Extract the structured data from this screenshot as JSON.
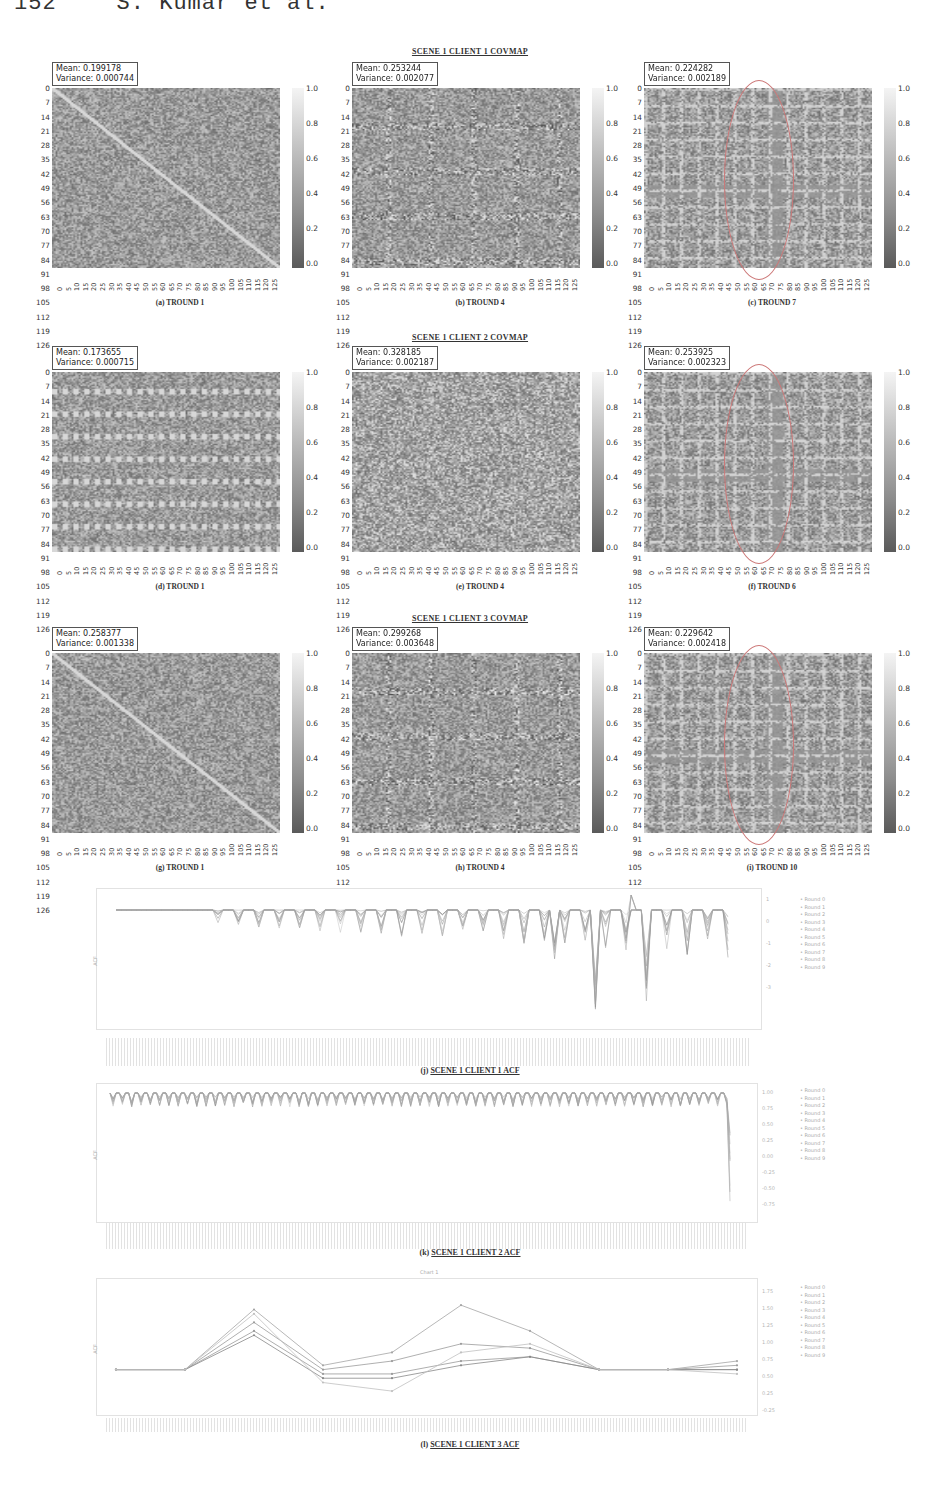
{
  "page": {
    "running_head": {
      "page_number": "152",
      "authors": "S. Kumar et al."
    }
  },
  "sections": [
    {
      "title": "SCENE 1 CLIENT 1 COVMAP"
    },
    {
      "title": "SCENE 1 CLIENT 2 COVMAP"
    },
    {
      "title": "SCENE 1 CLIENT 3 COVMAP"
    }
  ],
  "heatmap_axis": {
    "y_ticks": [
      "0",
      "7",
      "14",
      "21",
      "28",
      "35",
      "42",
      "49",
      "56",
      "63",
      "70",
      "77",
      "84",
      "91",
      "98",
      "105",
      "112",
      "119",
      "126"
    ],
    "x_ticks": [
      "0",
      "5",
      "10",
      "15",
      "20",
      "25",
      "30",
      "35",
      "40",
      "45",
      "50",
      "55",
      "60",
      "65",
      "70",
      "75",
      "80",
      "85",
      "90",
      "95",
      "100",
      "105",
      "110",
      "115",
      "120",
      "125"
    ],
    "colorbar_ticks": [
      "1.0",
      "0.8",
      "0.6",
      "0.4",
      "0.2",
      "0.0"
    ]
  },
  "panels": [
    {
      "id": "a",
      "caption": "(a) TROUND 1",
      "mean": "Mean: 0.199178",
      "variance": "Variance: 0.000744",
      "seed": 11,
      "pattern": "diagonal",
      "circled": false
    },
    {
      "id": "b",
      "caption": "(b) TROUND 4",
      "mean": "Mean: 0.253244",
      "variance": "Variance: 0.002077",
      "seed": 22,
      "pattern": "grid",
      "circled": false
    },
    {
      "id": "c",
      "caption": "(c) TROUND 7",
      "mean": "Mean: 0.224282",
      "variance": "Variance: 0.002189",
      "seed": 33,
      "pattern": "band",
      "circled": true
    },
    {
      "id": "d",
      "caption": "(d) TROUND 1",
      "mean": "Mean: 0.173655",
      "variance": "Variance: 0.000715",
      "seed": 44,
      "pattern": "stripes",
      "circled": false
    },
    {
      "id": "e",
      "caption": "(e) TROUND 4",
      "mean": "Mean: 0.328185",
      "variance": "Variance: 0.002187",
      "seed": 55,
      "pattern": "noise",
      "circled": false
    },
    {
      "id": "f",
      "caption": "(f) TROUND 6",
      "mean": "Mean: 0.253925",
      "variance": "Variance: 0.002323",
      "seed": 66,
      "pattern": "band",
      "circled": true
    },
    {
      "id": "g",
      "caption": "(g) TROUND 1",
      "mean": "Mean: 0.258377",
      "variance": "Variance: 0.001338",
      "seed": 77,
      "pattern": "diagonal",
      "circled": false
    },
    {
      "id": "h",
      "caption": "(h) TROUND 4",
      "mean": "Mean: 0.299268",
      "variance": "Variance: 0.003648",
      "seed": 88,
      "pattern": "grid",
      "circled": false
    },
    {
      "id": "i",
      "caption": "(i) TROUND 10",
      "mean": "Mean: 0.229642",
      "variance": "Variance: 0.002418",
      "seed": 99,
      "pattern": "band",
      "circled": true
    }
  ],
  "acf_plots": [
    {
      "id": "j",
      "caption_prefix": "(j) ",
      "caption": "SCENE 1 CLIENT 1 ACF",
      "chart_title": "",
      "ylabel": "ACF",
      "right_ticks": [
        "1",
        "0",
        "-1",
        "-2",
        "-3"
      ],
      "legend": [
        "Round 0",
        "Round 1",
        "Round 2",
        "Round 3",
        "Round 4",
        "Round 5",
        "Round 6",
        "Round 7",
        "Round 8",
        "Round 9"
      ]
    },
    {
      "id": "k",
      "caption_prefix": "(k) ",
      "caption": "SCENE 1 CLIENT 2 ACF",
      "chart_title": "",
      "ylabel": "ACF",
      "right_ticks": [
        "1.00",
        "0.75",
        "0.50",
        "0.25",
        "0.00",
        "-0.25",
        "-0.50",
        "-0.75"
      ],
      "legend": [
        "Round 0",
        "Round 1",
        "Round 2",
        "Round 3",
        "Round 4",
        "Round 5",
        "Round 6",
        "Round 7",
        "Round 8",
        "Round 9"
      ]
    },
    {
      "id": "l",
      "caption_prefix": "(l) ",
      "caption": "SCENE 1 CLIENT 3 ACF",
      "chart_title": "Chart 1",
      "ylabel": "ACF",
      "right_ticks": [
        "1.75",
        "1.50",
        "1.25",
        "1.00",
        "0.75",
        "0.50",
        "0.25",
        "-0.25"
      ],
      "legend": [
        "Round 0",
        "Round 1",
        "Round 2",
        "Round 3",
        "Round 4",
        "Round 5",
        "Round 6",
        "Round 7",
        "Round 8",
        "Round 9"
      ]
    }
  ],
  "chart_data": [
    {
      "type": "heatmap",
      "title": "SCENE 1 CLIENT 1 COVMAP",
      "panels": [
        {
          "label": "(a) TROUND 1",
          "mean": 0.199178,
          "variance": 0.000744
        },
        {
          "label": "(b) TROUND 4",
          "mean": 0.253244,
          "variance": 0.002077
        },
        {
          "label": "(c) TROUND 7",
          "mean": 0.224282,
          "variance": 0.002189,
          "annotation": "circled vertical band near column ~75"
        }
      ],
      "xlim": [
        0,
        127
      ],
      "ylim": [
        0,
        127
      ],
      "colorbar_range": [
        0.0,
        1.0
      ]
    },
    {
      "type": "heatmap",
      "title": "SCENE 1 CLIENT 2 COVMAP",
      "panels": [
        {
          "label": "(d) TROUND 1",
          "mean": 0.173655,
          "variance": 0.000715
        },
        {
          "label": "(e) TROUND 4",
          "mean": 0.328185,
          "variance": 0.002187
        },
        {
          "label": "(f) TROUND 6",
          "mean": 0.253925,
          "variance": 0.002323,
          "annotation": "circled vertical band near column ~75"
        }
      ],
      "xlim": [
        0,
        127
      ],
      "ylim": [
        0,
        127
      ],
      "colorbar_range": [
        0.0,
        1.0
      ]
    },
    {
      "type": "heatmap",
      "title": "SCENE 1 CLIENT 3 COVMAP",
      "panels": [
        {
          "label": "(g) TROUND 1",
          "mean": 0.258377,
          "variance": 0.001338
        },
        {
          "label": "(h) TROUND 4",
          "mean": 0.299268,
          "variance": 0.003648
        },
        {
          "label": "(i) TROUND 10",
          "mean": 0.229642,
          "variance": 0.002418,
          "annotation": "circled vertical band near column ~75"
        }
      ],
      "xlim": [
        0,
        127
      ],
      "ylim": [
        0,
        127
      ],
      "colorbar_range": [
        0.0,
        1.0
      ]
    },
    {
      "type": "line",
      "title": "SCENE 1 CLIENT 1 ACF",
      "ylabel": "ACF",
      "series_names": [
        "Round 0",
        "Round 1",
        "Round 2",
        "Round 3",
        "Round 4",
        "Round 5",
        "Round 6",
        "Round 7",
        "Round 8",
        "Round 9"
      ],
      "description": "ACF ~1 flat for first ~15% of lags, then recurring downward dips growing deeper toward the right; deepest dip ≈ -3.5 near 78% of x-range",
      "ylim": [
        -3.8,
        1.5
      ],
      "envelope_min": [
        1,
        1,
        1,
        1,
        1,
        1,
        0.8,
        0.6,
        0.7,
        0.5,
        0.6,
        0.4,
        0.0,
        -0.3,
        0.1,
        -0.3,
        -0.2,
        0.2,
        -0.6,
        -1.0,
        -3.5,
        -0.8,
        -1.2,
        0.4,
        -0.9,
        1.0
      ]
    },
    {
      "type": "line",
      "title": "SCENE 1 CLIENT 2 ACF",
      "ylabel": "ACF",
      "series_names": [
        "Round 0",
        "Round 1",
        "Round 2",
        "Round 3",
        "Round 4",
        "Round 5",
        "Round 6",
        "Round 7",
        "Round 8",
        "Round 9"
      ],
      "description": "ACF ~1 with many small periodic dips (to ~0.7) across all lags; sharp drop to ≈ -0.85 at the final lag",
      "ylim": [
        -0.9,
        1.05
      ]
    },
    {
      "type": "line",
      "title": "SCENE 1 CLIENT 3 ACF",
      "chart_title": "Chart 1",
      "ylabel": "ACF",
      "x": [
        0,
        1,
        2,
        3,
        4,
        5,
        6,
        7,
        8,
        9
      ],
      "series": [
        {
          "name": "Round 0",
          "values": [
            1.0,
            1.0,
            1.45,
            0.95,
            0.95,
            1.1,
            1.15,
            1.0,
            1.0,
            1.0
          ]
        },
        {
          "name": "Round 3",
          "values": [
            1.0,
            1.0,
            1.4,
            0.9,
            0.9,
            1.05,
            1.15,
            1.0,
            1.0,
            1.0
          ]
        },
        {
          "name": "Round 5",
          "values": [
            1.0,
            1.0,
            1.55,
            1.0,
            1.1,
            1.3,
            1.25,
            1.0,
            1.0,
            1.05
          ]
        },
        {
          "name": "Round 7",
          "values": [
            1.0,
            1.0,
            1.7,
            1.05,
            1.2,
            1.75,
            1.45,
            1.0,
            1.0,
            1.1
          ]
        },
        {
          "name": "Round 9",
          "values": [
            1.0,
            1.0,
            1.65,
            0.85,
            0.75,
            1.2,
            1.3,
            1.0,
            1.0,
            0.95
          ]
        }
      ],
      "ylim": [
        0.6,
        1.95
      ]
    }
  ]
}
